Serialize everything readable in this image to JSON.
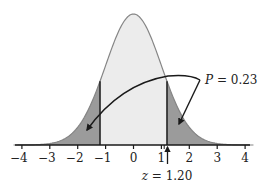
{
  "chart_data": {
    "type": "area",
    "title": "",
    "xlabel": "",
    "ylabel": "",
    "x_ticks": [
      -4,
      -3,
      -2,
      -1,
      0,
      1,
      2,
      3,
      4
    ],
    "x_tick_labels": [
      "−4",
      "−3",
      "−2",
      "−1",
      "0",
      "1",
      "2",
      "3",
      "4"
    ],
    "xlim": [
      -4.3,
      4.3
    ],
    "grid": false,
    "legend": null,
    "distribution": {
      "name": "standard normal",
      "mean": 0,
      "sd": 1
    },
    "critical_values": [
      -1.2,
      1.2
    ],
    "shaded_regions": [
      {
        "from": -4.3,
        "to": -1.2,
        "color": "#9b9b9b"
      },
      {
        "from": 1.2,
        "to": 4.3,
        "color": "#9b9b9b"
      }
    ],
    "center_region": {
      "from": -1.2,
      "to": 1.2,
      "color": "#ececec"
    },
    "annotations": [
      {
        "text_var": "P",
        "text_rest": " = 0.23",
        "value": 0.23,
        "points_to": [
          "left tail",
          "right tail"
        ]
      },
      {
        "text_var": "z",
        "text_rest": " = 1.20",
        "value": 1.2,
        "points_to": "x = 1.20 on axis"
      }
    ]
  },
  "colors": {
    "tail_fill": "#9b9b9b",
    "center_fill": "#ececec",
    "curve_stroke": "#858585",
    "axis": "#1a1a1a",
    "arrow": "#1a1a1a"
  }
}
